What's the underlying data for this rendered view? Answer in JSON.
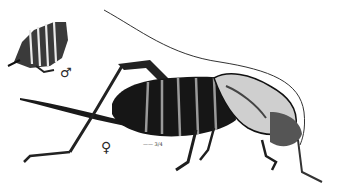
{
  "illustration": {
    "subject": "katydid / bush-cricket engraving",
    "male_symbol": "♂",
    "female_symbol": "♀",
    "scale_mark": "—— 3/4",
    "ink_color": "#111111",
    "paper_color": "#ffffff"
  }
}
